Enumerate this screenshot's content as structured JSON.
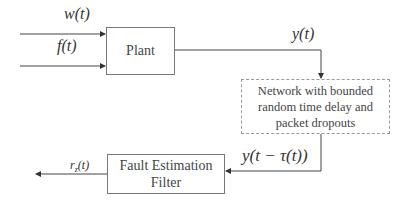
{
  "diagram": {
    "blocks": {
      "plant": {
        "label": "Plant"
      },
      "network": {
        "label": "Network with bounded random time delay and packet dropouts",
        "style": "dashed"
      },
      "filter": {
        "label": "Fault Estimation Filter"
      }
    },
    "signals": {
      "w": "w(t)",
      "f": "f(t)",
      "y": "y(t)",
      "y_delayed": "y(t − τ(t))",
      "r_base": "r",
      "r_sub": "z",
      "r_arg": "(t)"
    },
    "edges": [
      {
        "from": "input",
        "to": "plant",
        "label": "w(t)"
      },
      {
        "from": "input",
        "to": "plant",
        "label": "f(t)"
      },
      {
        "from": "plant",
        "to": "network",
        "label": "y(t)"
      },
      {
        "from": "network",
        "to": "filter",
        "label": "y(t − τ(t))"
      },
      {
        "from": "filter",
        "to": "output",
        "label": "r_z(t)"
      }
    ],
    "colors": {
      "line": "#444444",
      "border": "#777777",
      "dashed_border": "#999999"
    }
  }
}
